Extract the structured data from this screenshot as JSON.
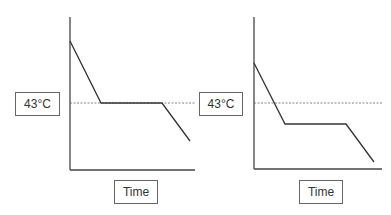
{
  "diagram": {
    "colors": {
      "line": "#333333",
      "axis": "#444444",
      "dashed": "#666666",
      "box_border": "#666666"
    },
    "panels": [
      {
        "id": "left",
        "y_label": "43°C",
        "x_label": "Time",
        "axis": {
          "x0": 70,
          "y_top": 17,
          "y_bottom": 170,
          "x_right": 195
        },
        "threshold_y": 103,
        "curve": [
          [
            70,
            41
          ],
          [
            101,
            103
          ],
          [
            162,
            103
          ],
          [
            190,
            141
          ]
        ],
        "y_box": {
          "left": 15,
          "top": 92,
          "width": 45,
          "height": 24
        },
        "x_box": {
          "left": 114,
          "top": 180,
          "width": 44,
          "height": 24
        }
      },
      {
        "id": "right",
        "y_label": "43°C",
        "x_label": "Time",
        "axis": {
          "x0": 254,
          "y_top": 17,
          "y_bottom": 169,
          "x_right": 382
        },
        "threshold_y": 103,
        "curve": [
          [
            254,
            63
          ],
          [
            285,
            124
          ],
          [
            346,
            124
          ],
          [
            374,
            162
          ]
        ],
        "y_box": {
          "left": 199,
          "top": 92,
          "width": 44,
          "height": 24
        },
        "x_box": {
          "left": 299,
          "top": 180,
          "width": 44,
          "height": 24
        }
      }
    ]
  }
}
